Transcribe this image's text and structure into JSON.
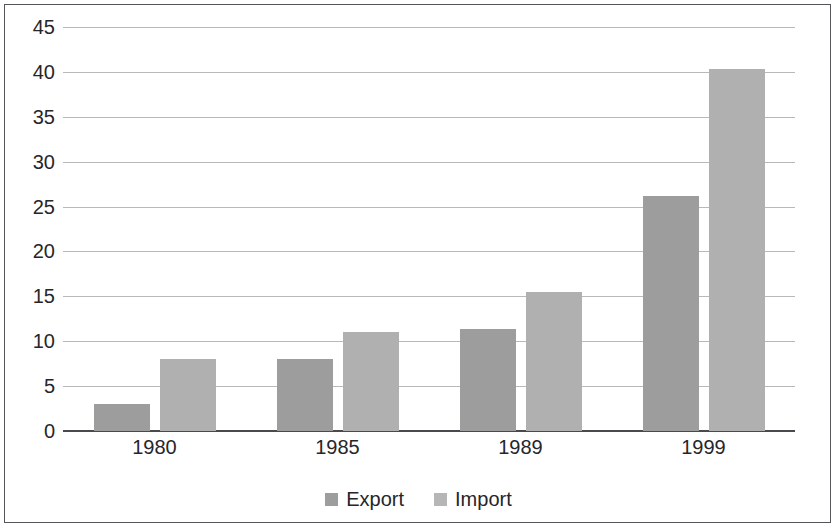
{
  "chart_data": {
    "type": "bar",
    "title": "",
    "subtitle": "",
    "xlabel": "",
    "ylabel": "",
    "categories": [
      "1980",
      "1985",
      "1989",
      "1999"
    ],
    "series": [
      {
        "name": "Export",
        "color": "#9d9d9d",
        "values": [
          3,
          8,
          11.4,
          26.2
        ]
      },
      {
        "name": "Import",
        "color": "#b0b0b0",
        "values": [
          8,
          11,
          15.5,
          40.3
        ]
      }
    ],
    "ylim": [
      0,
      45
    ],
    "ytick_labels": [
      "0",
      "5",
      "10",
      "15",
      "20",
      "25",
      "30",
      "35",
      "40",
      "45"
    ],
    "ytick_values": [
      0,
      5,
      10,
      15,
      20,
      25,
      30,
      35,
      40,
      45
    ],
    "grid": true,
    "legend_position": "bottom",
    "frame": true
  }
}
